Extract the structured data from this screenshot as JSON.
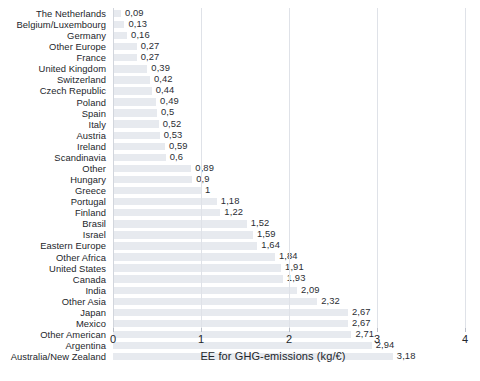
{
  "chart_data": {
    "type": "bar",
    "orientation": "horizontal",
    "title": "",
    "xlabel": "EE for GHG-emissions (kg/€)",
    "ylabel": "",
    "xlim": [
      0,
      4
    ],
    "xticks": [
      "0",
      "1",
      "2",
      "3",
      "4"
    ],
    "grid": true,
    "legend": false,
    "value_decimal_separator": ",",
    "categories": [
      "The Netherlands",
      "Belgium/Luxembourg",
      "Germany",
      "Other Europe",
      "France",
      "United Kingdom",
      "Switzerland",
      "Czech Republic",
      "Poland",
      "Spain",
      "Italy",
      "Austria",
      "Ireland",
      "Scandinavia",
      "Other",
      "Hungary",
      "Greece",
      "Portugal",
      "Finland",
      "Brasil",
      "Israel",
      "Eastern Europe",
      "Other Africa",
      "United States",
      "Canada",
      "India",
      "Other Asia",
      "Japan",
      "Mexico",
      "Other American",
      "Argentina",
      "Australia/New Zealand"
    ],
    "values": [
      0.09,
      0.13,
      0.16,
      0.27,
      0.27,
      0.39,
      0.42,
      0.44,
      0.49,
      0.5,
      0.52,
      0.53,
      0.59,
      0.6,
      0.89,
      0.9,
      1,
      1.18,
      1.22,
      1.52,
      1.59,
      1.64,
      1.84,
      1.91,
      1.93,
      2.09,
      2.32,
      2.67,
      2.67,
      2.71,
      2.94,
      3.18
    ],
    "value_labels": [
      "0,09",
      "0,13",
      "0,16",
      "0,27",
      "0,27",
      "0,39",
      "0,42",
      "0,44",
      "0,49",
      "0,5",
      "0,52",
      "0,53",
      "0,59",
      "0,6",
      "0,89",
      "0,9",
      "1",
      "1,18",
      "1,22",
      "1,52",
      "1,59",
      "1,64",
      "1,84",
      "1,91",
      "1,93",
      "2,09",
      "2,32",
      "2,67",
      "2,67",
      "2,71",
      "2,94",
      "3,18"
    ]
  },
  "colors": {
    "bar": "#e7eaef",
    "gridline": "#dfe2e8",
    "text": "#23262b",
    "background": "#ffffff"
  }
}
